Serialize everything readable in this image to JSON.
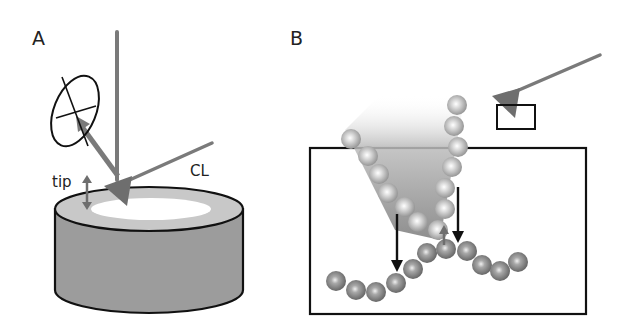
{
  "figure": {
    "panel_a": {
      "label": "A",
      "annotations": {
        "tip": "tip",
        "cantilever": "CL"
      }
    },
    "panel_b": {
      "label": "B"
    }
  },
  "colors": {
    "stroke": "#111111",
    "beam_gray": "#7a7a7a",
    "sample_side": "#9c9c9c",
    "sample_rim": "#c8c8c8",
    "sample_center": "#ffffff",
    "bead_light": "#d4d4d4",
    "bead_dark": "#8a8a8a"
  }
}
